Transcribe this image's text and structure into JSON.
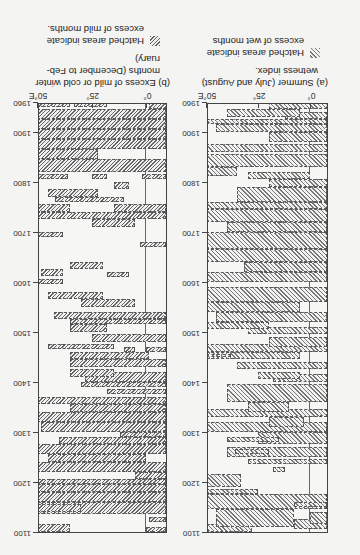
{
  "orientation": "rotated-180",
  "chart_data": [
    {
      "type": "area",
      "title": "(a) Summer (July and August) wetness index.",
      "legend": "Hatched areas indicate excess of wet months",
      "xlabel": "Longitude",
      "ylabel": "Year",
      "xticks": [
        "0°",
        "25°",
        "50°E"
      ],
      "yticks": [
        "1100",
        "1200",
        "1300",
        "1400",
        "1500",
        "1600",
        "1700",
        "1800",
        "1900",
        "1960"
      ],
      "xlim": [
        -8,
        50
      ],
      "ylim": [
        1100,
        1960
      ],
      "segments_note": "hatched regions as [year_start, year_end, lon_west, lon_east] (approximate)",
      "segments": [
        [
          1100,
          1115,
          28,
          50
        ],
        [
          1105,
          1125,
          -8,
          8
        ],
        [
          1115,
          1140,
          -8,
          0
        ],
        [
          1110,
          1145,
          8,
          45
        ],
        [
          1145,
          1175,
          -8,
          50
        ],
        [
          1175,
          1185,
          25,
          50
        ],
        [
          1150,
          1160,
          -8,
          8
        ],
        [
          1190,
          1215,
          33,
          50
        ],
        [
          1220,
          1230,
          12,
          18
        ],
        [
          1235,
          1245,
          -8,
          30
        ],
        [
          1250,
          1270,
          -8,
          40
        ],
        [
          1255,
          1265,
          20,
          36
        ],
        [
          1275,
          1300,
          -8,
          25
        ],
        [
          1280,
          1290,
          15,
          40
        ],
        [
          1300,
          1320,
          -8,
          50
        ],
        [
          1310,
          1330,
          3,
          20
        ],
        [
          1330,
          1345,
          -8,
          50
        ],
        [
          1340,
          1360,
          10,
          30
        ],
        [
          1360,
          1395,
          -8,
          40
        ],
        [
          1400,
          1415,
          -8,
          18
        ],
        [
          1405,
          1420,
          5,
          25
        ],
        [
          1425,
          1440,
          -8,
          35
        ],
        [
          1445,
          1460,
          5,
          50
        ],
        [
          1450,
          1455,
          38,
          50
        ],
        [
          1460,
          1475,
          -8,
          50
        ],
        [
          1470,
          1490,
          -8,
          20
        ],
        [
          1495,
          1510,
          -8,
          30
        ],
        [
          1505,
          1520,
          20,
          50
        ],
        [
          1520,
          1540,
          -8,
          45
        ],
        [
          1540,
          1560,
          5,
          50
        ],
        [
          1560,
          1590,
          -8,
          50
        ],
        [
          1600,
          1620,
          -8,
          50
        ],
        [
          1620,
          1640,
          -8,
          32
        ],
        [
          1640,
          1665,
          -8,
          50
        ],
        [
          1665,
          1700,
          -8,
          50
        ],
        [
          1700,
          1720,
          -8,
          40
        ],
        [
          1720,
          1745,
          -8,
          50
        ],
        [
          1745,
          1760,
          -8,
          50
        ],
        [
          1760,
          1790,
          -8,
          35
        ],
        [
          1790,
          1805,
          -8,
          20
        ],
        [
          1805,
          1820,
          0,
          30
        ],
        [
          1812,
          1830,
          35,
          50
        ],
        [
          1830,
          1855,
          -8,
          50
        ],
        [
          1860,
          1875,
          -8,
          50
        ],
        [
          1880,
          1900,
          -8,
          20
        ],
        [
          1900,
          1915,
          -8,
          45
        ],
        [
          1915,
          1925,
          -8,
          50
        ],
        [
          1925,
          1940,
          -8,
          12
        ],
        [
          1930,
          1945,
          5,
          40
        ],
        [
          1945,
          1960,
          -8,
          20
        ]
      ]
    },
    {
      "type": "area",
      "title": "(b) Excess of mild or cold winter months (December to February)",
      "legend": "Hatched areas indicate excess of mild months.",
      "xlabel": "Longitude",
      "ylabel": "Year",
      "xticks": [
        "0°",
        "25°",
        "50°E"
      ],
      "yticks": [
        "1100",
        "1200",
        "1300",
        "1400",
        "1500",
        "1600",
        "1700",
        "1800",
        "1900",
        "1960"
      ],
      "xlim": [
        -9,
        50
      ],
      "ylim": [
        1100,
        1960
      ],
      "segments_note": "hatched regions as [year_start, year_end, lon_west, lon_east] (approximate)",
      "segments": [
        [
          1100,
          1110,
          -9,
          0
        ],
        [
          1100,
          1115,
          35,
          50
        ],
        [
          1120,
          1130,
          -9,
          -1
        ],
        [
          1135,
          1160,
          -9,
          50
        ],
        [
          1140,
          1155,
          30,
          50
        ],
        [
          1160,
          1180,
          -9,
          50
        ],
        [
          1180,
          1195,
          -9,
          50
        ],
        [
          1195,
          1205,
          -9,
          50
        ],
        [
          1205,
          1220,
          -9,
          5
        ],
        [
          1220,
          1240,
          -9,
          50
        ],
        [
          1240,
          1255,
          0,
          45
        ],
        [
          1255,
          1275,
          -9,
          50
        ],
        [
          1275,
          1290,
          -9,
          40
        ],
        [
          1290,
          1300,
          -9,
          12
        ],
        [
          1300,
          1320,
          -9,
          48
        ],
        [
          1320,
          1340,
          -9,
          50
        ],
        [
          1340,
          1355,
          -9,
          35
        ],
        [
          1355,
          1370,
          -9,
          50
        ],
        [
          1375,
          1385,
          -9,
          18
        ],
        [
          1390,
          1400,
          -9,
          30
        ],
        [
          1400,
          1420,
          -9,
          28
        ],
        [
          1410,
          1425,
          15,
          35
        ],
        [
          1430,
          1445,
          -9,
          35
        ],
        [
          1445,
          1460,
          -1,
          35
        ],
        [
          1460,
          1470,
          5,
          10
        ],
        [
          1460,
          1470,
          -9,
          0
        ],
        [
          1465,
          1475,
          15,
          45
        ],
        [
          1480,
          1495,
          -9,
          25
        ],
        [
          1500,
          1515,
          18,
          35
        ],
        [
          1515,
          1525,
          -9,
          35
        ],
        [
          1525,
          1540,
          -9,
          42
        ],
        [
          1550,
          1565,
          5,
          30
        ],
        [
          1565,
          1580,
          20,
          45
        ],
        [
          1595,
          1605,
          38,
          50
        ],
        [
          1610,
          1620,
          8,
          18
        ],
        [
          1612,
          1625,
          38,
          48
        ],
        [
          1625,
          1640,
          20,
          35
        ],
        [
          1670,
          1680,
          -9,
          3
        ],
        [
          1690,
          1700,
          38,
          50
        ],
        [
          1710,
          1725,
          5,
          25
        ],
        [
          1725,
          1740,
          -9,
          50
        ],
        [
          1740,
          1755,
          -9,
          15
        ],
        [
          1740,
          1755,
          35,
          50
        ],
        [
          1760,
          1770,
          10,
          42
        ],
        [
          1770,
          1785,
          22,
          45
        ],
        [
          1785,
          1800,
          8,
          15
        ],
        [
          1805,
          1815,
          -9,
          2
        ],
        [
          1805,
          1815,
          18,
          25
        ],
        [
          1805,
          1815,
          36,
          50
        ],
        [
          1820,
          1845,
          -9,
          50
        ],
        [
          1845,
          1865,
          22,
          50
        ],
        [
          1865,
          1885,
          -9,
          50
        ],
        [
          1885,
          1905,
          -9,
          50
        ],
        [
          1905,
          1925,
          -9,
          50
        ],
        [
          1925,
          1945,
          -9,
          50
        ],
        [
          1945,
          1960,
          -9,
          -1
        ],
        [
          1950,
          1960,
          18,
          33
        ],
        [
          1950,
          1960,
          35,
          50
        ]
      ]
    }
  ],
  "panels": {
    "a": {
      "caption_line1": "(a) Summer (July and August)",
      "caption_line2": "wetness index.",
      "legend_line1": "Hatched areas indicate",
      "legend_line2": "excess of wet months"
    },
    "b": {
      "caption_line1": "(b) Excess of mild or cold winter",
      "caption_line2": "months (December to Feb-",
      "caption_line3": "ruary)",
      "legend_line1": "Hatched areas indicate",
      "legend_line2": "excess of mild months."
    }
  }
}
